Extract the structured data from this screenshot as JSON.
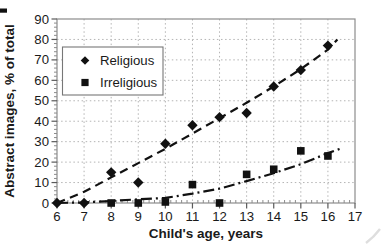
{
  "figure": {
    "background": "#ffffff"
  },
  "chart_data": {
    "type": "scatter",
    "title": "",
    "xlabel": "Child's age, years",
    "ylabel": "Abstract images, % of total",
    "xlim": [
      6,
      17
    ],
    "ylim": [
      0,
      90
    ],
    "xticks": [
      6,
      7,
      8,
      9,
      10,
      11,
      12,
      13,
      14,
      15,
      16,
      17
    ],
    "yticks": [
      0,
      10,
      20,
      30,
      40,
      50,
      60,
      70,
      80,
      90
    ],
    "x_minor_step": 0.2,
    "y_minor_step": 2,
    "grid": true,
    "legend": {
      "position": "upper-left-inside",
      "items": [
        "Religious",
        "Irreligious"
      ]
    },
    "series": [
      {
        "name": "Religious",
        "marker": "diamond",
        "trend_style": "dashed",
        "points": [
          [
            6,
            0
          ],
          [
            7,
            0
          ],
          [
            8,
            15
          ],
          [
            9,
            10
          ],
          [
            10,
            29
          ],
          [
            11,
            38
          ],
          [
            12,
            42
          ],
          [
            13,
            44
          ],
          [
            14,
            57
          ],
          [
            15,
            65
          ],
          [
            16,
            77
          ]
        ],
        "trend": [
          [
            6,
            0
          ],
          [
            7,
            5.5
          ],
          [
            8,
            12.5
          ],
          [
            9,
            19.5
          ],
          [
            10,
            26.5
          ],
          [
            11,
            34
          ],
          [
            12,
            41.5
          ],
          [
            13,
            49
          ],
          [
            14,
            57
          ],
          [
            15,
            65.5
          ],
          [
            16,
            75
          ],
          [
            16.35,
            80
          ]
        ]
      },
      {
        "name": "Irreligious",
        "marker": "square",
        "trend_style": "dash-dot",
        "points": [
          [
            8,
            0
          ],
          [
            9,
            0
          ],
          [
            10,
            0.5
          ],
          [
            11,
            9
          ],
          [
            12,
            0
          ],
          [
            13,
            14
          ],
          [
            14,
            16.5
          ],
          [
            15,
            25.5
          ],
          [
            16,
            23
          ]
        ],
        "trend": [
          [
            6,
            0
          ],
          [
            7,
            0.3
          ],
          [
            8,
            1
          ],
          [
            9,
            1.8
          ],
          [
            10,
            2.5
          ],
          [
            11,
            4.6
          ],
          [
            12,
            7
          ],
          [
            13,
            10.7
          ],
          [
            14,
            14.6
          ],
          [
            15,
            19
          ],
          [
            16,
            24.4
          ],
          [
            16.45,
            26.5
          ]
        ]
      }
    ],
    "colors": {
      "series": "#111111",
      "grid": "#b4b4b4",
      "axis": "#8c8c8c",
      "tick": "#5a5a5a",
      "text": "#1a1a1a",
      "legend_border": "#777777",
      "background": "#ffffff"
    }
  }
}
